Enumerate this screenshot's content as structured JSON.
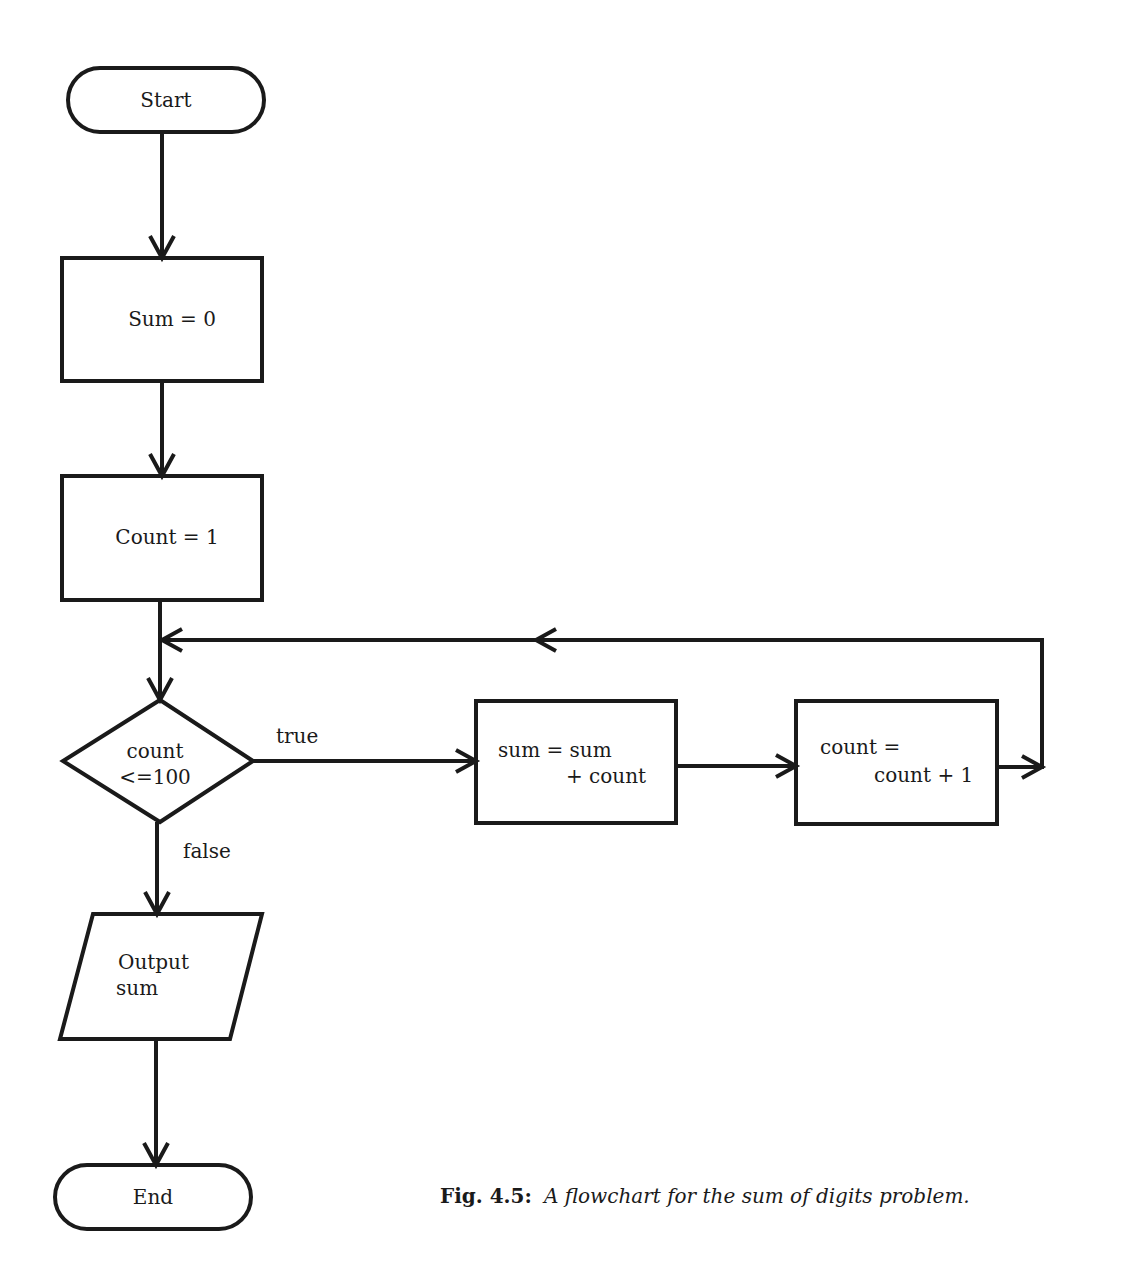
{
  "diagram": {
    "nodes": {
      "start": {
        "shape": "terminator",
        "label": "Start"
      },
      "init_sum": {
        "shape": "process",
        "label": "Sum = 0"
      },
      "init_count": {
        "shape": "process",
        "label": "Count = 1"
      },
      "decision": {
        "shape": "decision",
        "line1": "count",
        "line2": "<=100"
      },
      "add": {
        "shape": "process",
        "line1": "sum = sum",
        "line2": "+ count"
      },
      "increment": {
        "shape": "process",
        "line1": "count =",
        "line2": "count + 1"
      },
      "output": {
        "shape": "io",
        "line1": "Output",
        "line2": "sum"
      },
      "end": {
        "shape": "terminator",
        "label": "End"
      }
    },
    "edges": {
      "true_label": "true",
      "false_label": "false"
    },
    "caption": {
      "number": "Fig. 4.5:",
      "text": "A flowchart for the sum of digits problem."
    },
    "colors": {
      "stroke": "#1a1a1a",
      "background": "#ffffff"
    }
  }
}
